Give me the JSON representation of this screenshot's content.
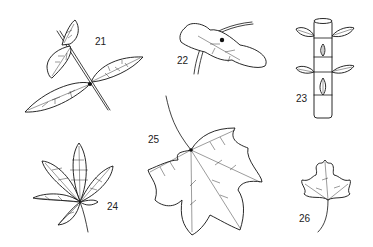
{
  "figure": {
    "background": "#ffffff",
    "ink_color": "#111111",
    "specimens": [
      {
        "id": "21",
        "label": "21",
        "description": "compound leaf with three leaflets on stem"
      },
      {
        "id": "22",
        "label": "22",
        "description": "broad wavy leaf with stalk"
      },
      {
        "id": "23",
        "label": "23",
        "description": "cylindrical stem with opposite leaves"
      },
      {
        "id": "24",
        "label": "24",
        "description": "palmate compound leaf, hatched"
      },
      {
        "id": "25",
        "label": "25",
        "description": "lobed maple-like leaf with long stalk"
      },
      {
        "id": "26",
        "label": "26",
        "description": "small lobed leaf with curved stalk"
      }
    ]
  }
}
